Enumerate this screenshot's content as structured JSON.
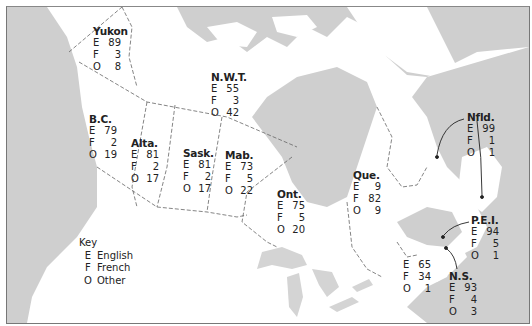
{
  "map": {
    "title": "Canadian home languages by province/territory (%)",
    "colors": {
      "water": "#cfcfcf",
      "land": "#ffffff",
      "border": "#666666",
      "text": "#222222"
    },
    "regions": [
      {
        "id": "yukon",
        "name": "Yukon",
        "E": "89",
        "F": "3",
        "O": "8"
      },
      {
        "id": "nwt",
        "name": "N.W.T.",
        "E": "55",
        "F": "3",
        "O": "42"
      },
      {
        "id": "bc",
        "name": "B.C.",
        "E": "79",
        "F": "2",
        "O": "19"
      },
      {
        "id": "alta",
        "name": "Alta.",
        "E": "81",
        "F": "2",
        "O": "17"
      },
      {
        "id": "sask",
        "name": "Sask.",
        "E": "81",
        "F": "2",
        "O": "17"
      },
      {
        "id": "mab",
        "name": "Mab.",
        "E": "73",
        "F": "5",
        "O": "22"
      },
      {
        "id": "ont",
        "name": "Ont.",
        "E": "75",
        "F": "5",
        "O": "20"
      },
      {
        "id": "que",
        "name": "Que.",
        "E": "9",
        "F": "82",
        "O": "9"
      },
      {
        "id": "nfld",
        "name": "Nfld.",
        "E": "99",
        "F": "1",
        "O": "1"
      },
      {
        "id": "pei",
        "name": "P.E.I.",
        "E": "94",
        "F": "5",
        "O": "1"
      },
      {
        "id": "nb",
        "name": "",
        "E": "65",
        "F": "34",
        "O": "1"
      },
      {
        "id": "ns",
        "name": "N.S.",
        "E": "93",
        "F": "4",
        "O": "3"
      }
    ],
    "key": {
      "title": "Key",
      "items": [
        {
          "code": "E",
          "label": "English"
        },
        {
          "code": "F",
          "label": "French"
        },
        {
          "code": "O",
          "label": "Other"
        }
      ]
    }
  }
}
